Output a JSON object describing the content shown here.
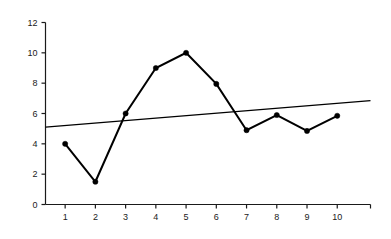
{
  "chart_data": {
    "type": "line",
    "title": "",
    "subtitle": "",
    "xlabel": "",
    "ylabel": "",
    "x": [
      1,
      2,
      3,
      4,
      5,
      6,
      7,
      8,
      9,
      10
    ],
    "categories": [
      "1",
      "2",
      "3",
      "4",
      "5",
      "6",
      "7",
      "8",
      "9",
      "10"
    ],
    "series": [
      {
        "name": "data",
        "type": "line",
        "markers": true,
        "color": "#000000",
        "values": [
          4.0,
          1.5,
          6.0,
          9.0,
          10.0,
          7.95,
          4.9,
          5.9,
          4.85,
          5.85
        ]
      },
      {
        "name": "trendline",
        "type": "line",
        "markers": false,
        "color": "#000000",
        "x_endpoints": [
          0.35,
          11.1
        ],
        "y_endpoints": [
          5.1,
          6.85
        ]
      }
    ],
    "xlim": [
      0.35,
      11.1
    ],
    "ylim": [
      0,
      12
    ],
    "xticks": [
      1,
      2,
      3,
      4,
      5,
      6,
      7,
      8,
      9,
      10
    ],
    "xtick_labels": [
      "1",
      "2",
      "3",
      "4",
      "5",
      "6",
      "7",
      "8",
      "9",
      "10"
    ],
    "yticks": [
      0,
      2,
      4,
      6,
      8,
      10,
      12
    ],
    "ytick_labels": [
      "0",
      "2",
      "4",
      "6",
      "8",
      "10",
      "12"
    ],
    "grid": false,
    "legend": false,
    "legend_position": "none",
    "annotations": [],
    "background_color": "#ffffff",
    "axis_color": "#1a1a1a"
  }
}
